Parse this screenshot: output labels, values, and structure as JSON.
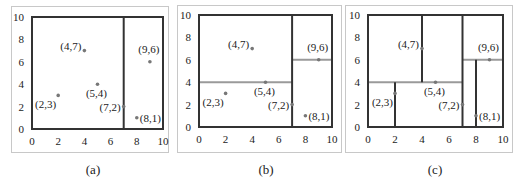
{
  "figure": {
    "axis": {
      "min": 0,
      "max": 10,
      "ticks": [
        "0",
        "2",
        "4",
        "6",
        "8",
        "10"
      ],
      "y_ticks": [
        "10",
        "8",
        "6",
        "4",
        "2",
        "0"
      ]
    },
    "points": [
      {
        "x": 2,
        "y": 3,
        "label": "(2,3)"
      },
      {
        "x": 4,
        "y": 7,
        "label": "(4,7)"
      },
      {
        "x": 5,
        "y": 4,
        "label": "(5,4)"
      },
      {
        "x": 7,
        "y": 2,
        "label": "(7,2)"
      },
      {
        "x": 8,
        "y": 1,
        "label": "(8,1)"
      },
      {
        "x": 9,
        "y": 6,
        "label": "(9,6)"
      }
    ],
    "colors": {
      "frame": "#c8c8c8",
      "plot_border": "#333333",
      "vertical_split": "#333333",
      "horizontal_split": "#9a9a9a",
      "point": "#777777"
    }
  },
  "panels": [
    {
      "caption": "(a)",
      "splits": [
        {
          "orientation": "vertical",
          "at": 7,
          "from": 0,
          "to": 10
        }
      ]
    },
    {
      "caption": "(b)",
      "splits": [
        {
          "orientation": "vertical",
          "at": 7,
          "from": 0,
          "to": 10
        },
        {
          "orientation": "horizontal",
          "at": 4,
          "from": 0,
          "to": 7
        },
        {
          "orientation": "horizontal",
          "at": 6,
          "from": 7,
          "to": 10
        }
      ]
    },
    {
      "caption": "(c)",
      "splits": [
        {
          "orientation": "vertical",
          "at": 7,
          "from": 0,
          "to": 10
        },
        {
          "orientation": "horizontal",
          "at": 4,
          "from": 0,
          "to": 7
        },
        {
          "orientation": "horizontal",
          "at": 6,
          "from": 7,
          "to": 10
        },
        {
          "orientation": "vertical",
          "at": 2,
          "from": 0,
          "to": 4
        },
        {
          "orientation": "vertical",
          "at": 4,
          "from": 4,
          "to": 10
        },
        {
          "orientation": "vertical",
          "at": 8,
          "from": 0,
          "to": 6
        }
      ]
    }
  ]
}
